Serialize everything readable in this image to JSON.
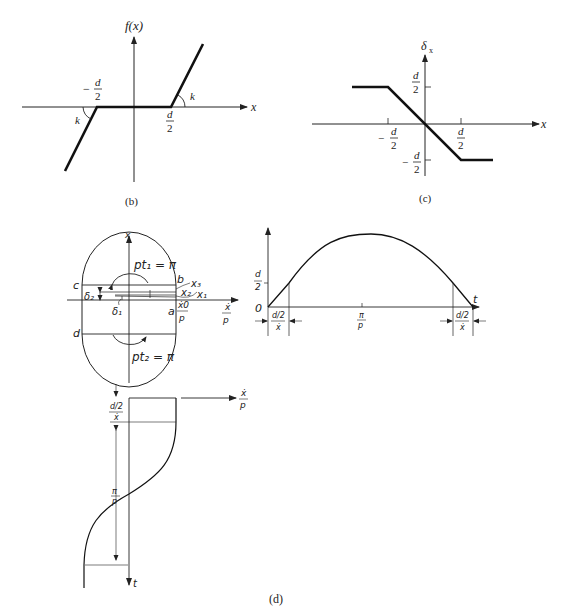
{
  "figure_b": {
    "caption": "(b)",
    "y_label": "f(x)",
    "x_label": "x",
    "neg_d_label": "d",
    "neg_d_denom": "2",
    "neg_sign": "−",
    "pos_d_label": "d",
    "pos_d_denom": "2",
    "slope_label_left": "k",
    "slope_label_right": "k"
  },
  "figure_c": {
    "caption": "(c)",
    "y_label": "δ",
    "y_label_sub": "x",
    "x_label": "x",
    "d_num": "d",
    "d_den": "2",
    "neg_sign": "−"
  },
  "figure_d": {
    "caption": "(d)",
    "phase_plane": {
      "y_axis_label": "x",
      "x_axis_label_num": "ẋ",
      "x_axis_label_den": "p",
      "x0_num": "ẋ0",
      "x0_den": "p",
      "points": [
        "a",
        "b",
        "c",
        "d"
      ],
      "top_arc_label": "pt₁ = π",
      "bottom_arc_label": "pt₂ = π",
      "trajectories": [
        "x₁",
        "x₂",
        "x₃"
      ],
      "delta1": "δ₁",
      "delta2": "δ₂"
    },
    "time_plot": {
      "y_tick_num": "d",
      "y_tick_den": "2",
      "origin": "0",
      "x_axis_label": "t",
      "mid_tick_num": "π",
      "mid_tick_den": "p",
      "left_interval_num": "d/2",
      "left_interval_den": "ẋ",
      "right_interval_num": "d/2",
      "right_interval_den": "ẋ"
    },
    "velocity_plot": {
      "x_axis_label_num": "ẋ",
      "x_axis_label_den": "p",
      "t_axis_label": "t",
      "interval_num": "d/2",
      "interval_den": "ẋ",
      "period_num": "π",
      "period_den": "p"
    }
  }
}
